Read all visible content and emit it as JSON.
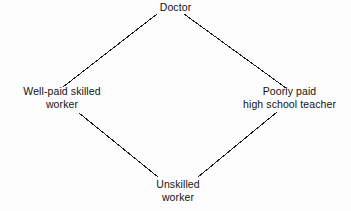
{
  "diagram": {
    "type": "diamond-hierarchy",
    "background_color": "#fdfdfd",
    "line_color": "#1a1a1a",
    "text_color": "#131313",
    "nodes": [
      {
        "id": "top",
        "position": "top",
        "lines": [
          "Doctor"
        ]
      },
      {
        "id": "left",
        "position": "left",
        "lines": [
          "Well-paid skilled",
          "worker"
        ]
      },
      {
        "id": "right",
        "position": "right",
        "lines": [
          "Poorly paid",
          "high school teacher"
        ]
      },
      {
        "id": "bottom",
        "position": "bottom",
        "lines": [
          "Unskilled",
          "worker"
        ]
      }
    ],
    "edges": [
      {
        "id": "top-left",
        "from": "top",
        "to": "left",
        "x1": 157,
        "y1": 14,
        "x2": 63,
        "y2": 87
      },
      {
        "id": "top-right",
        "from": "top",
        "to": "right",
        "x1": 184,
        "y1": 14,
        "x2": 286,
        "y2": 88
      },
      {
        "id": "left-bottom",
        "from": "left",
        "to": "bottom",
        "x1": 79,
        "y1": 113,
        "x2": 158,
        "y2": 177
      },
      {
        "id": "right-bottom",
        "from": "right",
        "to": "bottom",
        "x1": 277,
        "y1": 112,
        "x2": 198,
        "y2": 177
      }
    ]
  }
}
